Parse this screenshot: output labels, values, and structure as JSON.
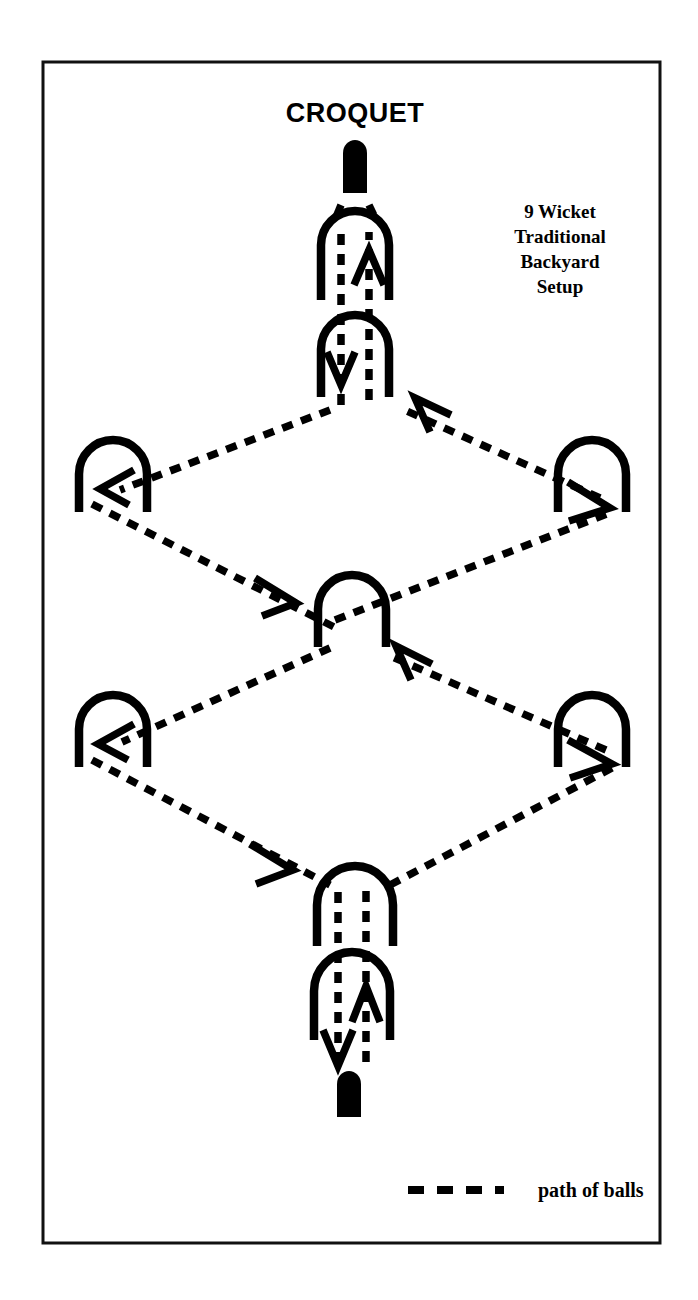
{
  "diagram": {
    "title": "CROQUET",
    "caption_lines": [
      "9 Wicket",
      "Traditional",
      "Backyard",
      "Setup"
    ],
    "legend": {
      "sample_label": "dashed-line-sample",
      "label": "path of balls"
    },
    "colors": {
      "ink": "#000000",
      "frame": "#111111",
      "background": "#ffffff"
    },
    "frame": {
      "x": 43,
      "y": 62,
      "width": 617,
      "height": 1181
    },
    "stakes": [
      {
        "name": "top-stake",
        "x": 343,
        "y": 140,
        "width": 24,
        "height": 53
      },
      {
        "name": "bottom-stake",
        "x": 337,
        "y": 1071,
        "width": 24,
        "height": 46
      }
    ],
    "wickets": [
      {
        "name": "wicket-1",
        "cx": 355,
        "top": 212,
        "width": 74,
        "height": 88
      },
      {
        "name": "wicket-2",
        "cx": 355,
        "top": 315,
        "width": 74,
        "height": 82
      },
      {
        "name": "wicket-3",
        "cx": 113,
        "top": 440,
        "width": 74,
        "height": 72
      },
      {
        "name": "wicket-4",
        "cx": 592,
        "top": 440,
        "width": 74,
        "height": 72
      },
      {
        "name": "wicket-5",
        "cx": 352,
        "top": 575,
        "width": 74,
        "height": 72
      },
      {
        "name": "wicket-6",
        "cx": 113,
        "top": 695,
        "width": 74,
        "height": 72
      },
      {
        "name": "wicket-7",
        "cx": 592,
        "top": 695,
        "width": 74,
        "height": 72
      },
      {
        "name": "wicket-8",
        "cx": 355,
        "top": 866,
        "width": 78,
        "height": 80
      },
      {
        "name": "wicket-9",
        "cx": 352,
        "top": 952,
        "width": 78,
        "height": 88
      }
    ],
    "ball_path_note": "dashed path of balls through nine wickets and two stakes"
  }
}
